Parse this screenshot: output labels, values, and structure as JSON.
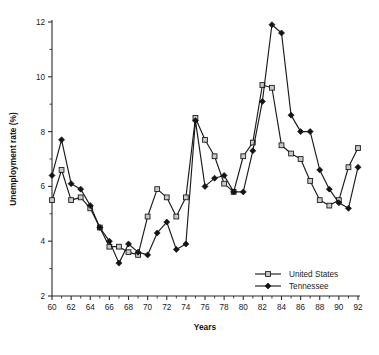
{
  "chart_data": {
    "type": "line",
    "title": "",
    "xlabel": "Years",
    "ylabel": "Unemployment rate (%)",
    "xlim": [
      60,
      92
    ],
    "ylim": [
      2,
      12
    ],
    "x_major_ticks": [
      60,
      62,
      64,
      66,
      68,
      70,
      72,
      74,
      76,
      78,
      80,
      82,
      84,
      86,
      88,
      90,
      92
    ],
    "x_minor_ticks": [
      61,
      63,
      65,
      67,
      69,
      71,
      73,
      75,
      77,
      79,
      81,
      83,
      85,
      87,
      89,
      91
    ],
    "y_major_ticks": [
      2,
      4,
      6,
      8,
      10,
      12
    ],
    "y_minor_ticks": [
      3,
      5,
      7,
      9,
      11
    ],
    "x_tick_labels": [
      "60",
      "62",
      "64",
      "66",
      "68",
      "70",
      "72",
      "74",
      "76",
      "78",
      "80",
      "82",
      "84",
      "86",
      "88",
      "90",
      "92"
    ],
    "y_tick_labels": [
      "2",
      "4",
      "6",
      "8",
      "10",
      "12"
    ],
    "grid": false,
    "legend_position": "lower-right",
    "x": [
      60,
      61,
      62,
      63,
      64,
      65,
      66,
      67,
      68,
      69,
      70,
      71,
      72,
      73,
      74,
      75,
      76,
      77,
      78,
      79,
      80,
      81,
      82,
      83,
      84,
      85,
      86,
      87,
      88,
      89,
      90,
      91,
      92
    ],
    "series": [
      {
        "name": "United States",
        "marker": "open-square",
        "values": [
          5.5,
          6.6,
          5.5,
          5.6,
          5.2,
          4.5,
          3.8,
          3.8,
          3.6,
          3.5,
          4.9,
          5.9,
          5.6,
          4.9,
          5.6,
          8.5,
          7.7,
          7.1,
          6.1,
          5.8,
          7.1,
          7.6,
          9.7,
          9.6,
          7.5,
          7.2,
          7.0,
          6.2,
          5.5,
          5.3,
          5.5,
          6.7,
          7.4
        ]
      },
      {
        "name": "Tennessee",
        "marker": "filled-diamond",
        "values": [
          6.4,
          7.7,
          6.1,
          5.9,
          5.3,
          4.5,
          4.0,
          3.2,
          3.9,
          3.6,
          3.5,
          4.3,
          4.7,
          3.7,
          3.9,
          8.4,
          6.0,
          6.3,
          6.4,
          5.8,
          5.8,
          7.3,
          9.1,
          11.9,
          11.6,
          8.6,
          8.0,
          8.0,
          6.6,
          5.9,
          5.4,
          5.2,
          6.7
        ]
      }
    ],
    "axis_px": {
      "x0": 52,
      "x1": 358,
      "y0_bottom": 296,
      "y1_top": 22
    }
  },
  "legend": {
    "items": [
      {
        "label": "United States",
        "marker": "open-square"
      },
      {
        "label": "Tennessee",
        "marker": "filled-diamond"
      }
    ]
  }
}
